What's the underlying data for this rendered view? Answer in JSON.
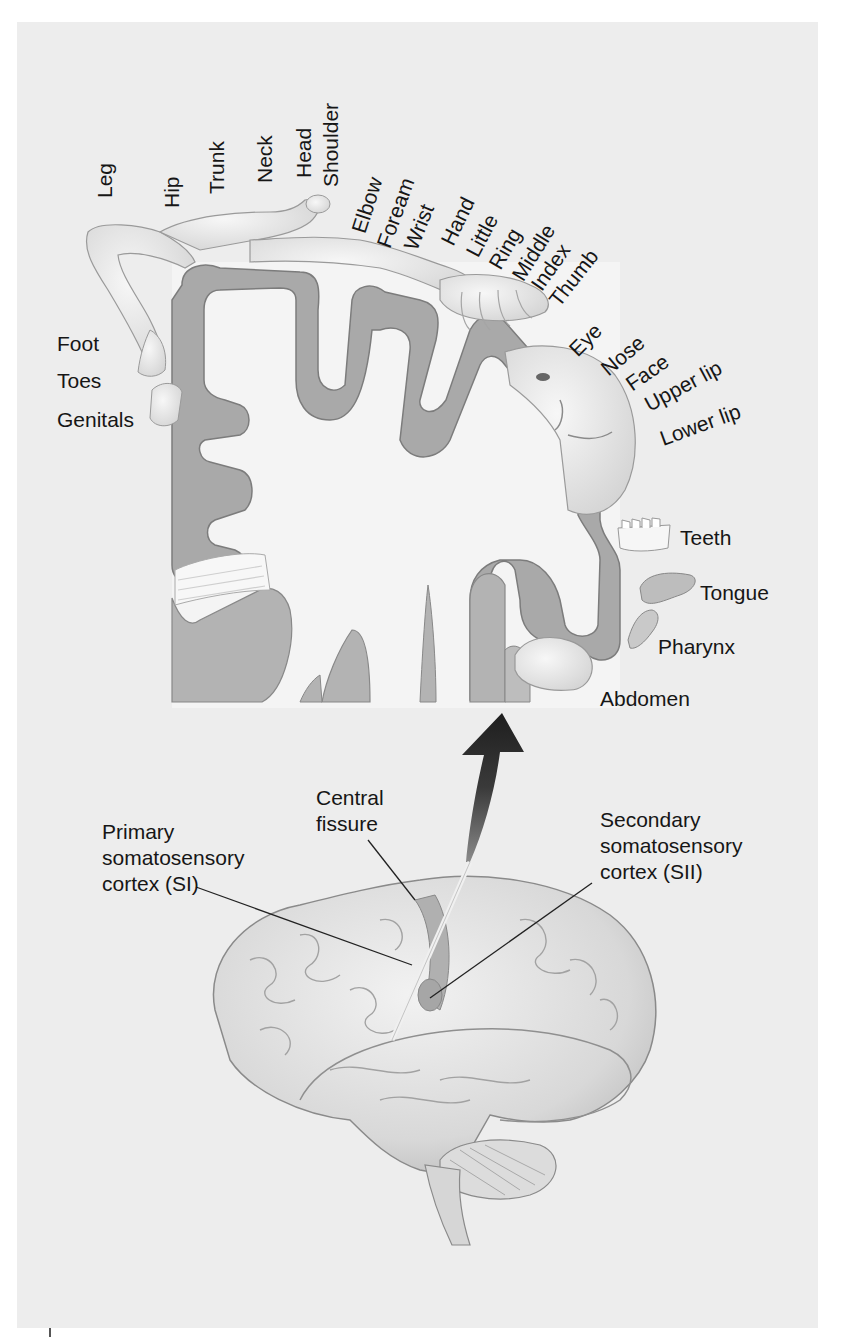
{
  "figure": {
    "background_color": "#ededed",
    "cortex_band_color": "#a9a9a9",
    "white_matter_color": "#f3f3f3",
    "arrow_color": "#2a2a2a"
  },
  "homunculus_labels": {
    "top": [
      "Leg",
      "Hip",
      "Trunk",
      "Neck",
      "Head",
      "Shoulder"
    ],
    "upper_limb": [
      "Elbow",
      "Foream",
      "Wrist",
      "Hand",
      "Little",
      "Ring",
      "Middle",
      "Index",
      "Thumb"
    ],
    "face": [
      "Eye",
      "Nose",
      "Face",
      "Upper lip",
      "Lower lip"
    ],
    "left": [
      "Foot",
      "Toes",
      "Genitals"
    ],
    "lower_right": [
      "Teeth",
      "Tongue",
      "Pharynx",
      "Abdomen"
    ]
  },
  "callouts": {
    "central_fissure": [
      "Central",
      "fissure"
    ],
    "primary": [
      "Primary",
      "somatosensory",
      "cortex (SI)"
    ],
    "secondary": [
      "Secondary",
      "somatosensory",
      "cortex (SII)"
    ]
  }
}
